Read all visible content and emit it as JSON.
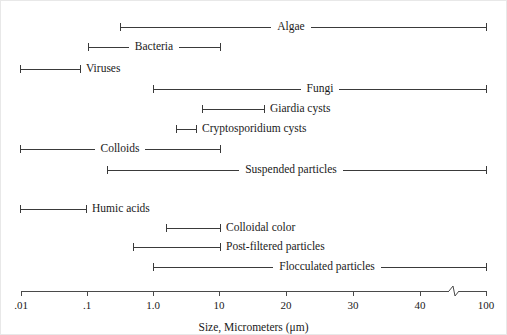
{
  "chart_data": {
    "type": "bar",
    "orientation": "horizontal-range",
    "title": "",
    "xlabel": "Size, Micrometers (μm)",
    "ylabel": "",
    "scale": "log-then-linear-with-break",
    "grid": false,
    "legend": null,
    "xlim": [
      0.01,
      100
    ],
    "axis": {
      "tick_labels": [
        ".01",
        ".1",
        "1.0",
        "10",
        "20",
        "30",
        "40",
        "100"
      ],
      "tick_values": [
        0.01,
        0.1,
        1.0,
        10,
        20,
        30,
        40,
        100
      ],
      "tick_pixels": [
        20,
        86,
        152,
        218,
        285,
        352,
        419,
        485
      ],
      "axis_break": {
        "present": true,
        "pixel": 453,
        "note": "zigzag break between 40 and 100"
      },
      "line_y": 290
    },
    "categories": [
      "Algae",
      "Bacteria",
      "Viruses",
      "Fungi",
      "Giardia cysts",
      "Cryptosporidium cysts",
      "Colloids",
      "Suspended particles",
      "Humic acids",
      "Colloidal color",
      "Post-filtered particles",
      "Flocculated particles"
    ],
    "ranges": [
      {
        "label": "Algae",
        "min": 0.5,
        "max": 100,
        "x0": 119,
        "x1": 485,
        "y": 26,
        "label_x": 290,
        "label_inside": true
      },
      {
        "label": "Bacteria",
        "min": 0.1,
        "max": 10,
        "x0": 87,
        "x1": 219,
        "y": 46,
        "label_x": 153,
        "label_inside": true
      },
      {
        "label": "Viruses",
        "min": 0.01,
        "max": 0.07,
        "x0": 19,
        "x1": 79,
        "y": 68,
        "label_x": 104,
        "label_inside": false
      },
      {
        "label": "Fungi",
        "min": 1.0,
        "max": 100,
        "x0": 152,
        "x1": 485,
        "y": 88,
        "label_x": 319,
        "label_inside": true
      },
      {
        "label": "Giardia cysts",
        "min": 2.0,
        "max": 18,
        "x0": 201,
        "x1": 263,
        "y": 108,
        "label_x": 301,
        "label_inside": false
      },
      {
        "label": "Cryptosporidium cysts",
        "min": 1.3,
        "max": 3.5,
        "x0": 175,
        "x1": 195,
        "y": 128,
        "label_x": 256,
        "label_inside": false
      },
      {
        "label": "Colloids",
        "min": 0.01,
        "max": 10,
        "x0": 19,
        "x1": 219,
        "y": 148,
        "label_x": 119,
        "label_inside": true
      },
      {
        "label": "Suspended particles",
        "min": 0.2,
        "max": 100,
        "x0": 106,
        "x1": 485,
        "y": 169,
        "label_x": 290,
        "label_inside": true
      },
      {
        "label": "Humic acids",
        "min": 0.01,
        "max": 0.09,
        "x0": 19,
        "x1": 85,
        "y": 208,
        "label_x": 122,
        "label_inside": false
      },
      {
        "label": "Colloidal color",
        "min": 1.5,
        "max": 10,
        "x0": 165,
        "x1": 219,
        "y": 227,
        "label_x": 265,
        "label_inside": false
      },
      {
        "label": "Post-filtered particles",
        "min": 0.55,
        "max": 10,
        "x0": 132,
        "x1": 219,
        "y": 246,
        "label_x": 277,
        "label_inside": false
      },
      {
        "label": "Flocculated particles",
        "min": 1.0,
        "max": 100,
        "x0": 152,
        "x1": 485,
        "y": 266,
        "label_x": 326,
        "label_inside": true
      }
    ]
  },
  "colors": {
    "background": "#ffffff",
    "line": "#3a3a3a",
    "axis": "#4a4a4a",
    "text": "#1a1a1a"
  }
}
